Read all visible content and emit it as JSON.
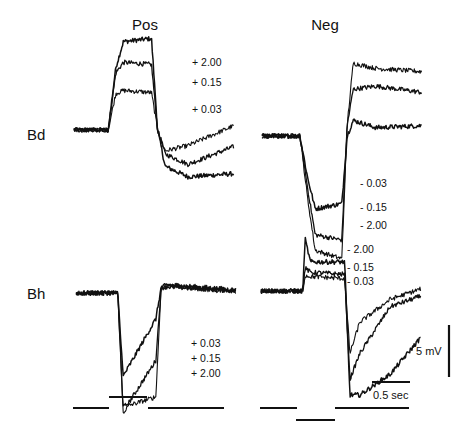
{
  "chart_data": {
    "type": "line",
    "title": "",
    "columns": [
      "Pos",
      "Neg"
    ],
    "rows": [
      "Bd",
      "Bh"
    ],
    "scale_bars": {
      "time_label": "0.5 sec",
      "time_value_s": 0.5,
      "voltage_label": "5 mV",
      "voltage_value_mV": 5
    },
    "time_range_s": [
      0,
      2.1
    ],
    "stimulus": {
      "Pos": {
        "baseline_s": [
          0,
          0.5
        ],
        "step_s": [
          0.5,
          1.0
        ],
        "post_s": [
          1.0,
          2.1
        ],
        "direction": "up"
      },
      "Neg": {
        "baseline_s": [
          0,
          0.5
        ],
        "step_s": [
          0.5,
          1.0
        ],
        "post_s": [
          1.0,
          2.1
        ],
        "direction": "down"
      }
    },
    "panels": [
      {
        "id": "Bd-Pos",
        "row": "Bd",
        "column": "Pos",
        "labels": [
          "+ 2.00",
          "+ 0.15",
          "+ 0.03"
        ],
        "series": [
          {
            "name": "+ 2.00",
            "t": [
              0,
              0.45,
              0.55,
              0.65,
              1.02,
              1.1,
              1.2,
              1.5,
              2.1
            ],
            "v": [
              0,
              0,
              6,
              8.5,
              8.8,
              0,
              -3.5,
              -4.5,
              -4.2
            ]
          },
          {
            "name": "+ 0.15",
            "t": [
              0,
              0.45,
              0.55,
              0.65,
              1.02,
              1.1,
              1.2,
              1.5,
              2.1
            ],
            "v": [
              0,
              0,
              5.5,
              6.5,
              6.3,
              0,
              -2.3,
              -3.3,
              -1.6
            ]
          },
          {
            "name": "+ 0.03",
            "t": [
              0,
              0.45,
              0.55,
              0.65,
              1.02,
              1.1,
              1.2,
              1.5,
              2.1
            ],
            "v": [
              0,
              0,
              3.5,
              3.8,
              3.6,
              0,
              -2.0,
              -1.5,
              0.4
            ]
          }
        ]
      },
      {
        "id": "Bd-Neg",
        "row": "Bd",
        "column": "Neg",
        "labels": [
          "- 0.03",
          "- 0.15",
          "- 2.00"
        ],
        "series": [
          {
            "name": "- 0.03",
            "t": [
              0,
              0.5,
              0.6,
              0.7,
              1.05,
              1.12,
              1.2,
              1.5,
              2.1
            ],
            "v": [
              0,
              0,
              -4,
              -7,
              -6.5,
              0,
              1.5,
              0.8,
              1.0
            ]
          },
          {
            "name": "- 0.15",
            "t": [
              0,
              0.5,
              0.6,
              0.7,
              1.05,
              1.12,
              1.2,
              1.5,
              2.1
            ],
            "v": [
              0,
              0,
              -5,
              -9.5,
              -10,
              1,
              4.5,
              4.8,
              4.2
            ]
          },
          {
            "name": "- 2.00",
            "t": [
              0,
              0.5,
              0.6,
              0.7,
              1.05,
              1.12,
              1.2,
              1.5,
              2.1
            ],
            "v": [
              0,
              0,
              -6,
              -11,
              -11.8,
              1,
              7,
              6.5,
              6.2
            ]
          }
        ]
      },
      {
        "id": "Bh-Pos",
        "row": "Bh",
        "column": "Pos",
        "labels": [
          "+ 0.03",
          "+ 0.15",
          "+ 2.00"
        ],
        "series": [
          {
            "name": "+ 0.03",
            "t": [
              0,
              0.55,
              0.62,
              0.7,
              1.05,
              1.12,
              1.2,
              2.1
            ],
            "v": [
              0,
              0,
              -8,
              -7,
              -2.5,
              0.5,
              0.8,
              0.3
            ]
          },
          {
            "name": "+ 0.15",
            "t": [
              0,
              0.55,
              0.62,
              0.7,
              1.05,
              1.12,
              1.2,
              2.1
            ],
            "v": [
              0,
              0,
              -11,
              -10.5,
              -6.5,
              0.5,
              0.6,
              0.2
            ]
          },
          {
            "name": "+ 2.00",
            "t": [
              0,
              0.55,
              0.62,
              0.7,
              1.05,
              1.12,
              1.2,
              2.1
            ],
            "v": [
              0,
              0,
              -11.5,
              -10.8,
              -10,
              0.5,
              0.7,
              0.1
            ]
          }
        ]
      },
      {
        "id": "Bh-Neg",
        "row": "Bh",
        "column": "Neg",
        "labels": [
          "- 2.00",
          "- 0.15",
          "- 0.03"
        ],
        "series": [
          {
            "name": "- 2.00",
            "t": [
              0,
              0.55,
              0.58,
              0.65,
              1.1,
              1.17,
              1.3,
              1.7,
              2.1
            ],
            "v": [
              0,
              0,
              5,
              2.8,
              2.8,
              -10,
              -10,
              -8,
              -4.5
            ]
          },
          {
            "name": "- 0.15",
            "t": [
              0,
              0.55,
              0.58,
              0.65,
              1.1,
              1.17,
              1.3,
              1.7,
              2.1
            ],
            "v": [
              0,
              0,
              2.2,
              1.8,
              1.6,
              -8.5,
              -6,
              -1.5,
              -0.5
            ]
          },
          {
            "name": "- 0.03",
            "t": [
              0,
              0.55,
              0.58,
              0.65,
              1.1,
              1.17,
              1.3,
              1.7,
              2.1
            ],
            "v": [
              0,
              0,
              1.5,
              1.4,
              1.2,
              -6,
              -3,
              -0.8,
              0.2
            ]
          }
        ]
      }
    ]
  }
}
